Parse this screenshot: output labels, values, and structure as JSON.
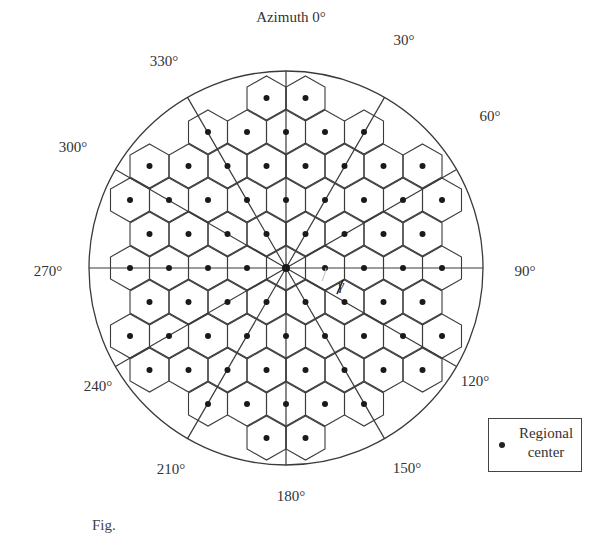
{
  "figure": {
    "title_label": "Azimuth 0°",
    "azimuth_labels": [
      {
        "text": "30°",
        "x": 404,
        "y": 40
      },
      {
        "text": "60°",
        "x": 490,
        "y": 116
      },
      {
        "text": "90°",
        "x": 525,
        "y": 271
      },
      {
        "text": "120°",
        "x": 475,
        "y": 381
      },
      {
        "text": "150°",
        "x": 407,
        "y": 468
      },
      {
        "text": "180°",
        "x": 291,
        "y": 496
      },
      {
        "text": "210°",
        "x": 171,
        "y": 469
      },
      {
        "text": "240°",
        "x": 98,
        "y": 386
      },
      {
        "text": "270°",
        "x": 48,
        "y": 271
      },
      {
        "text": "300°",
        "x": 73,
        "y": 147
      },
      {
        "text": "330°",
        "x": 164,
        "y": 61
      }
    ],
    "azimuth_title_pos": {
      "x": 291,
      "y": 17
    },
    "center": {
      "x": 286,
      "y": 268
    },
    "circle_radius": 197,
    "hex_spacing": 39,
    "row_spacing": 34,
    "inclusion_radius": 178,
    "spoke_angles_deg": [
      0,
      30,
      60,
      90,
      120,
      150,
      180,
      210,
      240,
      270,
      300,
      330
    ],
    "angle_marker_label": "γ",
    "line_color": "#3a3a3a",
    "dot_color": "#1a1a1a"
  },
  "legend": {
    "marker": "dot",
    "label_line1": "Regional",
    "label_line2": "center"
  },
  "caption": {
    "text": "Fig."
  }
}
